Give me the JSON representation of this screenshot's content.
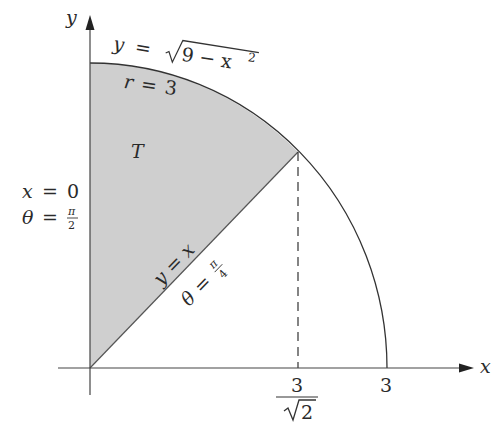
{
  "diagram": {
    "type": "polar region sketch",
    "axes": {
      "x_label": "x",
      "y_label": "y",
      "x_ticks": [
        {
          "numerator": "3",
          "denominator": "√2",
          "radicand": "2"
        },
        {
          "label": "3"
        }
      ]
    },
    "region": {
      "name": "T",
      "fill": "#cfcfcf",
      "stroke": "#555555"
    },
    "curves": {
      "circle_label_cartesian": {
        "lhs": "y",
        "eq": "=",
        "radical": "√",
        "radicand": "9 − x",
        "exp": "2"
      },
      "circle_label_polar": {
        "lhs": "r",
        "eq": "=",
        "rhs": "3"
      },
      "line_label_cartesian": {
        "lhs": "y",
        "eq": "=",
        "rhs": "x"
      },
      "line_label_polar": {
        "lhs": "θ",
        "eq": "=",
        "num": "π",
        "den": "4"
      },
      "yaxis_label_cartesian": {
        "lhs": "x",
        "eq": "=",
        "rhs": "0"
      },
      "yaxis_label_polar": {
        "lhs": "θ",
        "eq": "=",
        "num": "π",
        "den": "2"
      }
    },
    "colors": {
      "line": "#333333",
      "shade": "#cfcfcf",
      "text": "#2a2a2a"
    }
  }
}
